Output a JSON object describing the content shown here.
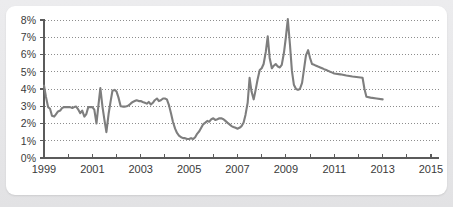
{
  "card": {
    "background_color": "#ffffff",
    "page_background_color": "#e9e9eb"
  },
  "chart_data": {
    "type": "line",
    "title": "",
    "subtitle": "",
    "xlabel": "",
    "ylabel": "",
    "grid": true,
    "legend_position": "none",
    "line_color": "#7e7e7e",
    "axis_color": "#5b5b5b",
    "xlim": [
      1999,
      2015
    ],
    "ylim": [
      0,
      8
    ],
    "y_tick_labels": [
      "8%",
      "7%",
      "6%",
      "5%",
      "4%",
      "3%",
      "2%",
      "1%",
      "0%"
    ],
    "y_tick_values": [
      8,
      7,
      6,
      5,
      4,
      3,
      2,
      1,
      0
    ],
    "x_tick_values": [
      1999,
      2000,
      2001,
      2002,
      2003,
      2004,
      2005,
      2006,
      2007,
      2008,
      2009,
      2010,
      2011,
      2012,
      2013,
      2014,
      2015
    ],
    "x_tick_labels": [
      "1999",
      "",
      "2001",
      "",
      "2003",
      "",
      "2005",
      "",
      "2007",
      "",
      "2009",
      "",
      "2011",
      "",
      "2013",
      "",
      "2015"
    ],
    "series": [
      {
        "name": "rate",
        "x": [
          1999.0,
          1999.08,
          1999.17,
          1999.25,
          1999.33,
          1999.42,
          1999.5,
          1999.58,
          1999.67,
          1999.75,
          1999.83,
          1999.92,
          2000.0,
          2000.08,
          2000.17,
          2000.25,
          2000.33,
          2000.42,
          2000.5,
          2000.58,
          2000.67,
          2000.75,
          2000.83,
          2000.92,
          2001.0,
          2001.08,
          2001.17,
          2001.25,
          2001.33,
          2001.42,
          2001.5,
          2001.58,
          2001.67,
          2001.75,
          2001.83,
          2001.92,
          2002.0,
          2002.08,
          2002.17,
          2002.25,
          2002.33,
          2002.42,
          2002.5,
          2002.58,
          2002.67,
          2002.75,
          2002.83,
          2002.92,
          2003.0,
          2003.08,
          2003.17,
          2003.25,
          2003.33,
          2003.42,
          2003.5,
          2003.58,
          2003.67,
          2003.75,
          2003.83,
          2003.92,
          2004.0,
          2004.08,
          2004.17,
          2004.25,
          2004.33,
          2004.42,
          2004.5,
          2004.58,
          2004.67,
          2004.75,
          2004.83,
          2004.92,
          2005.0,
          2005.08,
          2005.17,
          2005.25,
          2005.33,
          2005.42,
          2005.5,
          2005.58,
          2005.67,
          2005.75,
          2005.83,
          2005.92,
          2006.0,
          2006.08,
          2006.17,
          2006.25,
          2006.33,
          2006.42,
          2006.5,
          2006.58,
          2006.67,
          2006.75,
          2006.83,
          2006.92,
          2007.0,
          2007.08,
          2007.17,
          2007.25,
          2007.33,
          2007.42,
          2007.5,
          2007.58,
          2007.67,
          2007.75,
          2007.83,
          2007.92,
          2008.0,
          2008.08,
          2008.17,
          2008.25,
          2008.33,
          2008.42,
          2008.5,
          2008.58,
          2008.67,
          2008.75,
          2008.83,
          2008.92,
          2009.0,
          2009.08,
          2009.17,
          2009.25,
          2009.33,
          2009.42,
          2009.5,
          2009.58,
          2009.67,
          2009.75,
          2009.83,
          2009.92,
          2010.0,
          2010.08,
          2010.17,
          2010.25,
          2010.33,
          2010.42,
          2010.5,
          2010.58,
          2010.67,
          2010.75,
          2010.83,
          2010.92,
          2011.0,
          2011.25,
          2011.5,
          2011.75,
          2012.0,
          2012.17,
          2012.25,
          2012.33,
          2012.5,
          2012.75,
          2013.0
        ],
        "values": [
          4.2,
          3.55,
          2.95,
          2.85,
          2.45,
          2.4,
          2.55,
          2.7,
          2.75,
          2.9,
          2.95,
          2.95,
          2.95,
          2.95,
          2.9,
          2.95,
          2.98,
          2.8,
          2.6,
          2.75,
          2.4,
          2.55,
          2.95,
          2.95,
          2.95,
          2.8,
          2.0,
          3.05,
          4.05,
          2.95,
          2.2,
          1.5,
          2.55,
          3.25,
          3.9,
          3.95,
          3.85,
          3.5,
          3.0,
          2.98,
          2.98,
          3.0,
          3.05,
          3.15,
          3.25,
          3.3,
          3.35,
          3.3,
          3.3,
          3.25,
          3.2,
          3.15,
          3.25,
          3.1,
          3.2,
          3.35,
          3.45,
          3.3,
          3.35,
          3.45,
          3.45,
          3.4,
          3.05,
          2.6,
          2.1,
          1.7,
          1.45,
          1.3,
          1.2,
          1.15,
          1.15,
          1.1,
          1.1,
          1.15,
          1.1,
          1.2,
          1.4,
          1.55,
          1.75,
          1.95,
          2.05,
          2.15,
          2.1,
          2.25,
          2.3,
          2.2,
          2.25,
          2.3,
          2.3,
          2.25,
          2.15,
          2.05,
          1.95,
          1.85,
          1.8,
          1.75,
          1.7,
          1.75,
          1.85,
          2.05,
          2.5,
          3.2,
          4.65,
          3.85,
          3.4,
          3.95,
          4.55,
          5.1,
          5.2,
          5.45,
          6.15,
          7.05,
          5.8,
          5.2,
          5.35,
          5.45,
          5.3,
          5.25,
          5.4,
          6.1,
          7.0,
          8.05,
          6.55,
          5.05,
          4.25,
          4.0,
          3.95,
          4.0,
          4.35,
          5.15,
          5.95,
          6.25,
          5.8,
          5.45,
          5.4,
          5.35,
          5.3,
          5.25,
          5.2,
          5.15,
          5.1,
          5.05,
          5.0,
          4.95,
          4.9,
          4.85,
          4.78,
          4.72,
          4.68,
          4.65,
          4.0,
          3.55,
          3.5,
          3.45,
          3.4
        ]
      }
    ],
    "annotations": []
  }
}
